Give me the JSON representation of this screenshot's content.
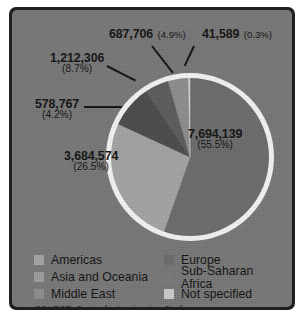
{
  "frame": {
    "panel_color": "#767676",
    "border_color": "#201f1e"
  },
  "source_note": "SOURCE: Center for Immigration Studies",
  "chart_data": {
    "type": "pie",
    "title": "",
    "total": 13899081,
    "categories": [
      "Europe",
      "Americas",
      "Asia and Oceania",
      "Sub-Saharan Africa",
      "Middle East",
      "Not specified"
    ],
    "values": [
      7694139,
      3684574,
      1212306,
      687706,
      578767,
      41589
    ],
    "value_labels": [
      "7,694,139",
      "3,684,574",
      "1,212,306",
      "687,706",
      "578,767",
      "41,589"
    ],
    "percents": [
      55.5,
      26.5,
      8.7,
      4.9,
      4.2,
      0.3
    ],
    "percent_labels": [
      "(55.5%)",
      "(26.5%)",
      "(8.7%)",
      "(4.9%)",
      "(4.2%)",
      "(0.3%)"
    ],
    "colors": [
      "#6a6a6a",
      "#a2a2a2",
      "#4a4a4a",
      "#5a5a5a",
      "#8c8c8c",
      "#d8d8d8"
    ],
    "start_angle_deg": 0,
    "direction": "clockwise",
    "ring_outline_color": "#f2f2f2",
    "legend_position": "bottom",
    "grid": false
  },
  "callouts": [
    {
      "id": "africa",
      "value": "687,706",
      "percent": "(4.9%)",
      "category": "Sub-Saharan Africa"
    },
    {
      "id": "notspec",
      "value": "41,589",
      "percent": "(0.3%)",
      "category": "Not specified"
    },
    {
      "id": "asia",
      "value": "1,212,306",
      "percent": "(8.7%)",
      "category": "Asia and Oceania"
    },
    {
      "id": "me",
      "value": "578,767",
      "percent": "(4.2%)",
      "category": "Middle East"
    },
    {
      "id": "americas",
      "value": "3,684,574",
      "percent": "(26.5%)",
      "category": "Americas"
    },
    {
      "id": "europe",
      "value": "7,694,139",
      "percent": "(55.5%)",
      "category": "Europe"
    }
  ],
  "legend": {
    "items": [
      {
        "label": "Americas",
        "color": "#a2a2a2"
      },
      {
        "label": "Europe",
        "color": "#6a6a6a"
      },
      {
        "label": "Asia and Oceania",
        "color": "#9b9b9b"
      },
      {
        "label": "Sub-Saharan Africa",
        "color": "#787878"
      },
      {
        "label": "Middle East",
        "color": "#8c8c8c"
      },
      {
        "label": "Not specified",
        "color": "#c9c9c9"
      }
    ]
  }
}
